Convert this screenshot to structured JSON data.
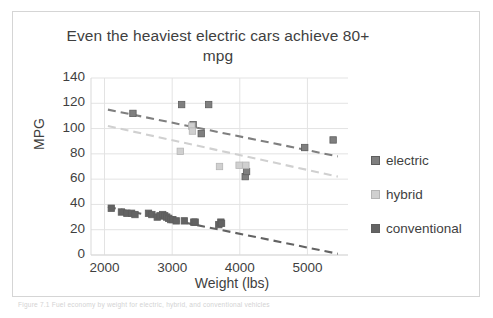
{
  "figure": {
    "caption": "Figure 7.1 Fuel economy by weight for electric, hybrid, and conventional vehicles"
  },
  "chart_data": {
    "type": "scatter",
    "title": "Even the heaviest electric cars achieve 80+ mpg",
    "xlabel": "Weight (lbs)",
    "ylabel": "MPG",
    "xlim": [
      1800,
      5600
    ],
    "ylim": [
      0,
      140
    ],
    "xticks": [
      2000,
      3000,
      4000,
      5000
    ],
    "yticks": [
      0,
      20,
      40,
      60,
      80,
      100,
      120,
      140
    ],
    "grid": "horizontal-and-vertical",
    "legend_position": "right",
    "colors": {
      "electric": "#7f7f7f",
      "hybrid": "#d0d0d0",
      "conventional": "#636363"
    },
    "series": [
      {
        "name": "electric",
        "marker": "square",
        "color": "#7f7f7f",
        "points": [
          [
            2420,
            112
          ],
          [
            3140,
            119
          ],
          [
            3540,
            119
          ],
          [
            3310,
            103
          ],
          [
            3430,
            96
          ],
          [
            4080,
            62
          ],
          [
            4100,
            66
          ],
          [
            4960,
            85
          ],
          [
            5380,
            91
          ]
        ],
        "trendline": {
          "x": [
            2050,
            5450
          ],
          "y": [
            115,
            78
          ]
        }
      },
      {
        "name": "hybrid",
        "marker": "square",
        "color": "#d0d0d0",
        "points": [
          [
            3120,
            82
          ],
          [
            3290,
            102
          ],
          [
            3300,
            98
          ],
          [
            3700,
            70
          ],
          [
            3990,
            71
          ],
          [
            4090,
            71
          ]
        ],
        "trendline": {
          "x": [
            2050,
            5450
          ],
          "y": [
            102,
            62
          ]
        }
      },
      {
        "name": "conventional",
        "marker": "square",
        "color": "#636363",
        "points": [
          [
            2100,
            37
          ],
          [
            2250,
            34
          ],
          [
            2330,
            33
          ],
          [
            2400,
            33
          ],
          [
            2450,
            32
          ],
          [
            2650,
            33
          ],
          [
            2700,
            32
          ],
          [
            2780,
            30
          ],
          [
            2820,
            31
          ],
          [
            2860,
            32
          ],
          [
            2890,
            31
          ],
          [
            2920,
            30
          ],
          [
            2950,
            29
          ],
          [
            2980,
            28
          ],
          [
            3010,
            28
          ],
          [
            3060,
            27
          ],
          [
            3180,
            27
          ],
          [
            3320,
            26
          ],
          [
            3340,
            26
          ],
          [
            3690,
            24
          ],
          [
            3720,
            26
          ],
          [
            3730,
            25
          ]
        ],
        "trendline": {
          "x": [
            2050,
            5450
          ],
          "y": [
            38,
            1
          ]
        }
      }
    ]
  },
  "legend": {
    "items": [
      {
        "label": "electric",
        "color": "#7f7f7f"
      },
      {
        "label": "hybrid",
        "color": "#d0d0d0"
      },
      {
        "label": "conventional",
        "color": "#636363"
      }
    ]
  }
}
